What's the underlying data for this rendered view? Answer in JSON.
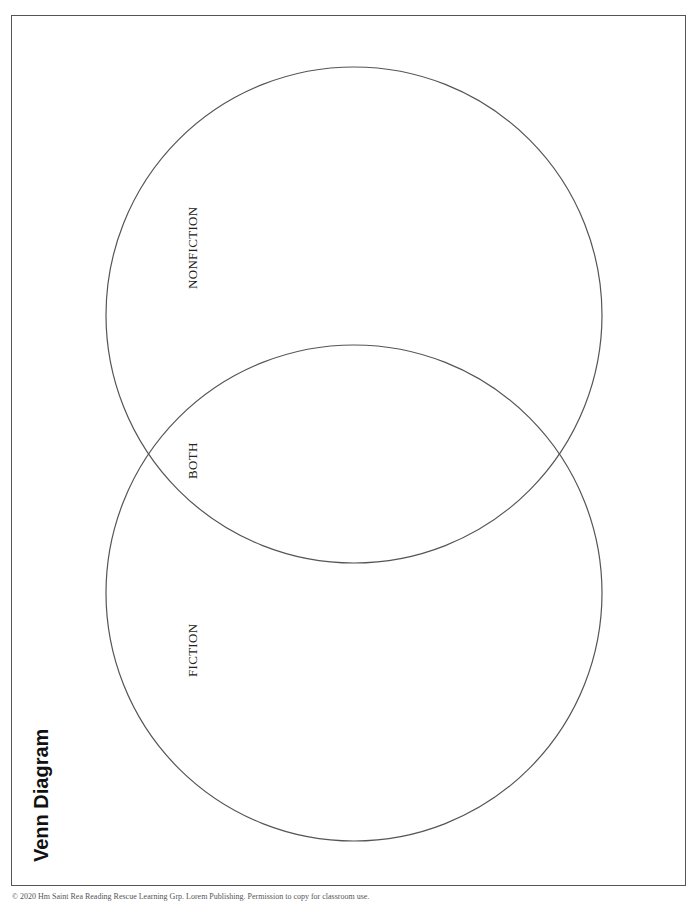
{
  "title": "Venn Diagram",
  "circles": [
    {
      "id": "nonfiction",
      "label": "NONFICTION",
      "cx": 354,
      "cy": 315,
      "r": 248
    },
    {
      "id": "fiction",
      "label": "FICTION",
      "cx": 354,
      "cy": 593,
      "r": 248
    }
  ],
  "overlap_label": "BOTH",
  "labels": {
    "nonfiction": "NONFICTION",
    "both": "BOTH",
    "fiction": "FICTION"
  },
  "footer": "© 2020 Hm Saint Rea Reading Rescue Learning Grp. Lorem Publishing. Permission to copy for classroom use.",
  "colors": {
    "stroke": "#555555",
    "text": "#222222",
    "background": "#ffffff"
  }
}
